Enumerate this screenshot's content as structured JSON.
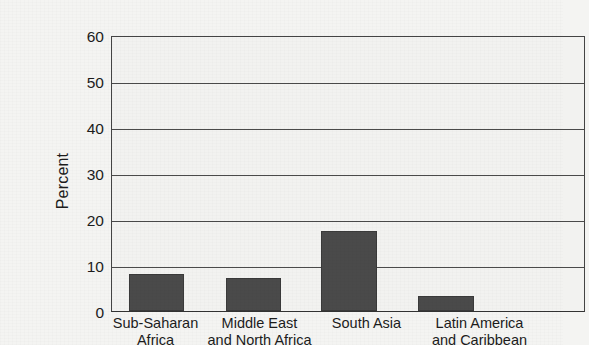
{
  "chart_data": {
    "type": "bar",
    "title": "",
    "subtitle": "",
    "xlabel": "",
    "ylabel": "Percent",
    "ylim": [
      0,
      60
    ],
    "yticks": [
      0,
      10,
      20,
      30,
      40,
      50,
      60
    ],
    "ytick_labels": [
      "0",
      "10",
      "20",
      "30",
      "40",
      "50",
      "60"
    ],
    "grid": true,
    "legend": false,
    "legend_position": "none",
    "categories": [
      "Sub-Saharan Africa",
      "Middle East and North Africa",
      "South Asia",
      "Latin America and Caribbean"
    ],
    "category_lines": [
      [
        "Sub-Saharan",
        "Africa"
      ],
      [
        "Middle East",
        "and North Africa"
      ],
      [
        "South Asia",
        ""
      ],
      [
        "Latin America",
        "and Caribbean"
      ]
    ],
    "values": [
      8.1,
      7.2,
      17.5,
      3.2
    ],
    "bar_color": "#4a4a4a",
    "plot_background": "#f2f2f0",
    "axis_color": "#444444",
    "text_color": "#1c1c1c"
  }
}
